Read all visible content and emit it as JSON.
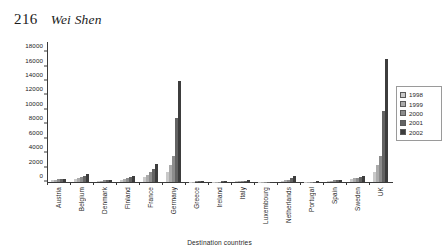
{
  "page": {
    "number": "216",
    "author": "Wei Shen"
  },
  "chart_data": {
    "type": "bar",
    "title": "",
    "xlabel": "Destination countries",
    "ylabel": "",
    "ylim": [
      0,
      19000
    ],
    "ytick_values": [
      0,
      2000,
      4000,
      6000,
      8000,
      10000,
      12000,
      14000,
      16000,
      18000
    ],
    "ytick_labels": [
      "0",
      "2000",
      "4000",
      "6000",
      "8000",
      "10000",
      "12000",
      "14000",
      "16000",
      "18000"
    ],
    "grid": false,
    "legend_position": "right",
    "categories": [
      "Austria",
      "Belgium",
      "Denmark",
      "Finland",
      "France",
      "Germany",
      "Greece",
      "Ireland",
      "Italy",
      "Luxembourg",
      "Netherlands",
      "Portugal",
      "Spain",
      "Sweden",
      "UK"
    ],
    "series": [
      {
        "name": "1998",
        "color": "#c9c9c9",
        "values": [
          260,
          430,
          170,
          330,
          700,
          1450,
          60,
          55,
          120,
          25,
          180,
          45,
          170,
          430,
          1450
        ]
      },
      {
        "name": "1999",
        "color": "#ababab",
        "values": [
          300,
          560,
          200,
          430,
          1000,
          2350,
          70,
          60,
          140,
          28,
          250,
          50,
          200,
          520,
          2400
        ]
      },
      {
        "name": "2000",
        "color": "#8c8c8c",
        "values": [
          350,
          700,
          230,
          560,
          1350,
          3600,
          80,
          70,
          165,
          32,
          330,
          58,
          240,
          620,
          3550
        ]
      },
      {
        "name": "2001",
        "color": "#636363",
        "values": [
          400,
          880,
          265,
          700,
          1800,
          8900,
          95,
          80,
          190,
          36,
          520,
          65,
          290,
          760,
          9800
        ]
      },
      {
        "name": "2002",
        "color": "#3d3d3d",
        "values": [
          470,
          1150,
          300,
          900,
          2550,
          13950,
          110,
          95,
          220,
          42,
          880,
          75,
          340,
          900,
          17000
        ]
      }
    ]
  }
}
